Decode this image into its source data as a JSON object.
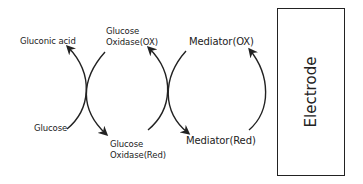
{
  "diagram": {
    "type": "redox-cycle",
    "labels": {
      "gluconic_acid": "Gluconic acid",
      "glucose": "Glucose",
      "glucose_oxidase_ox_line1": "Glucose",
      "glucose_oxidase_ox_line2": "Oxidase(OX)",
      "glucose_oxidase_red_line1": "Glucose",
      "glucose_oxidase_red_line2": "Oxidase(Red)",
      "mediator_ox": "Mediator(OX)",
      "mediator_red": "Mediator(Red)",
      "electrode": "Electrode"
    },
    "colors": {
      "stroke": "#222222",
      "background": "#ffffff"
    },
    "arrows": [
      {
        "from": "Glucose",
        "to": "Gluconic acid"
      },
      {
        "from": "Glucose Oxidase(OX)",
        "to": "Glucose Oxidase(Red)"
      },
      {
        "from": "Glucose Oxidase(Red)",
        "to": "Glucose Oxidase(OX)"
      },
      {
        "from": "Mediator(OX)",
        "to": "Mediator(Red)"
      },
      {
        "from": "Mediator(Red)",
        "to": "Mediator(OX)"
      }
    ]
  }
}
